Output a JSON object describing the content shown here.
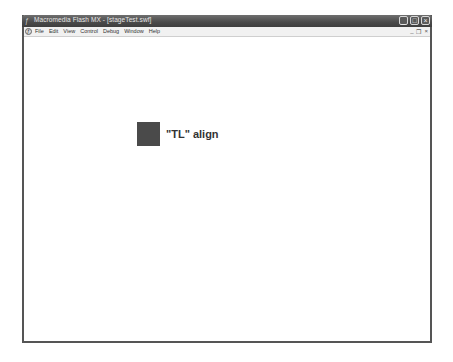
{
  "window": {
    "title": "Macromedia Flash MX - [stageTest.swf]",
    "controls": {
      "minimize": "_",
      "maximize": "□",
      "close": "×"
    },
    "mdi_controls": {
      "minimize": "_",
      "restore": "❐",
      "close": "×"
    }
  },
  "menubar": {
    "items": [
      {
        "label": "File"
      },
      {
        "label": "Edit"
      },
      {
        "label": "View"
      },
      {
        "label": "Control"
      },
      {
        "label": "Debug"
      },
      {
        "label": "Window"
      },
      {
        "label": "Help"
      }
    ]
  },
  "stage": {
    "square_color": "#4a4a4a",
    "label": "\"TL\" align"
  }
}
